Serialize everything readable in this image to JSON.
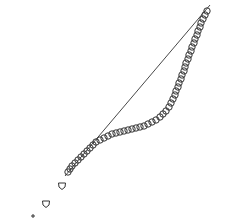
{
  "title_clipped": "",
  "chart_data": {
    "type": "scatter",
    "title": "",
    "xlabel": "",
    "ylabel": "",
    "grid": false,
    "reference_line": {
      "x1": 210,
      "y1": 5,
      "x2": 65,
      "y2": 176,
      "color": "#333333"
    },
    "series": [
      {
        "name": "points",
        "marker": "open-circle",
        "color": "#333333",
        "points": [
          [
            207,
            11
          ],
          [
            205,
            15
          ],
          [
            203,
            19
          ],
          [
            201,
            23
          ],
          [
            200,
            27
          ],
          [
            198,
            31
          ],
          [
            197,
            35
          ],
          [
            195,
            39
          ],
          [
            194,
            43
          ],
          [
            192,
            47
          ],
          [
            191,
            51
          ],
          [
            189,
            55
          ],
          [
            188,
            59
          ],
          [
            186,
            63
          ],
          [
            185,
            67
          ],
          [
            184,
            71
          ],
          [
            182,
            75
          ],
          [
            181,
            79
          ],
          [
            179,
            83
          ],
          [
            178,
            87
          ],
          [
            176,
            91
          ],
          [
            175,
            95
          ],
          [
            173,
            99
          ],
          [
            171,
            103
          ],
          [
            169,
            107
          ],
          [
            166,
            111
          ],
          [
            163,
            114
          ],
          [
            160,
            117
          ],
          [
            156,
            120
          ],
          [
            152,
            122
          ],
          [
            148,
            124
          ],
          [
            144,
            126
          ],
          [
            140,
            127
          ],
          [
            136,
            128
          ],
          [
            132,
            129
          ],
          [
            128,
            130
          ],
          [
            124,
            131
          ],
          [
            120,
            132
          ],
          [
            116,
            133
          ],
          [
            112,
            134
          ],
          [
            108,
            136
          ],
          [
            104,
            138
          ],
          [
            100,
            140
          ],
          [
            96,
            142
          ],
          [
            93,
            145
          ],
          [
            90,
            148
          ],
          [
            87,
            151
          ],
          [
            84,
            154
          ],
          [
            81,
            157
          ],
          [
            78,
            160
          ],
          [
            75,
            163
          ],
          [
            72,
            166
          ],
          [
            70,
            169
          ],
          [
            68,
            172
          ]
        ]
      },
      {
        "name": "tail",
        "marker": "open-triangle",
        "color": "#333333",
        "points": [
          [
            62,
            186
          ],
          [
            46,
            204
          ]
        ]
      },
      {
        "name": "outlier",
        "marker": "plus",
        "color": "#333333",
        "points": [
          [
            33,
            216
          ]
        ]
      }
    ]
  }
}
